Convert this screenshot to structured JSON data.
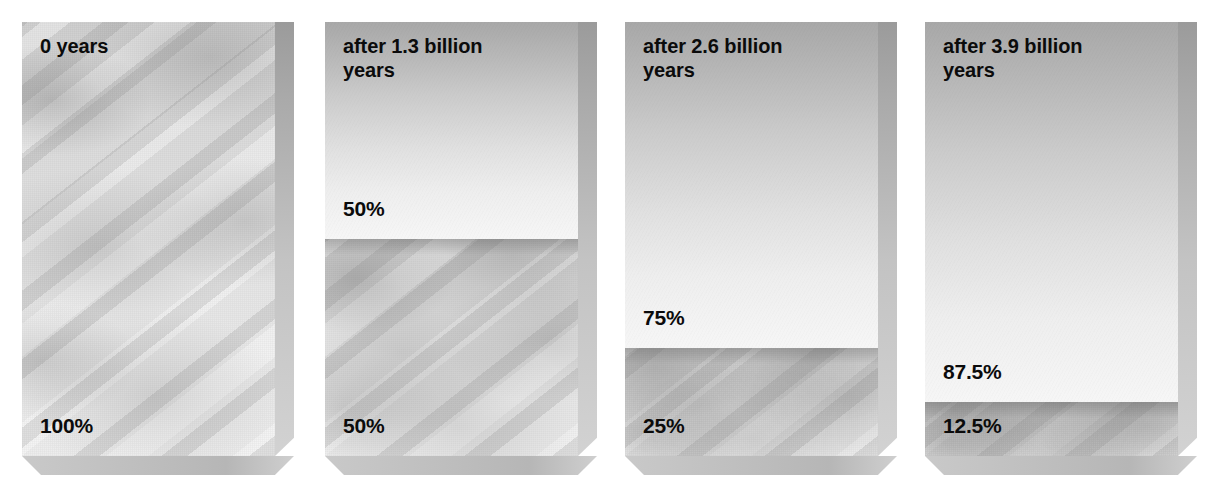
{
  "figure": {
    "type": "decay-block-sequence",
    "background_color": "#ffffff",
    "text_color": "#0b0b0b",
    "block_count": 4
  },
  "chart_data": {
    "type": "bar",
    "xlabel": "",
    "ylabel": "",
    "ylim": [
      0,
      100
    ],
    "grid": false,
    "legend": "none",
    "categories": [
      "0 years",
      "after 1.3 billion years",
      "after 2.6 billion years",
      "after 3.9 billion years"
    ],
    "series": [
      {
        "name": "daughter product (decayed)",
        "values": [
          0,
          50,
          75,
          87.5
        ],
        "fill": "smooth-gradient"
      },
      {
        "name": "parent isotope (remaining)",
        "values": [
          100,
          50,
          25,
          12.5
        ],
        "fill": "mottled-texture"
      }
    ],
    "half_life_billion_years": 1.3,
    "annotations": [
      "0 years",
      "100%",
      "after 1.3 billion years",
      "50%",
      "50%",
      "after 2.6 billion years",
      "75%",
      "25%",
      "after 3.9 billion years",
      "87.5%",
      "12.5%"
    ]
  },
  "blocks": [
    {
      "id": "block-0-years",
      "time_label": "0 years",
      "left": 22,
      "segments": [
        {
          "fill": "mottled",
          "percent_label": "100%",
          "height_pct": 100,
          "has_shadow": false
        }
      ]
    },
    {
      "id": "block-1-3-billion-years",
      "time_label": "after 1.3 billion\nyears",
      "left": 325,
      "segments": [
        {
          "fill": "smooth",
          "percent_label": "50%",
          "height_pct": 50,
          "has_shadow": false
        },
        {
          "fill": "mottled",
          "percent_label": "50%",
          "height_pct": 50,
          "has_shadow": true
        }
      ]
    },
    {
      "id": "block-2-6-billion-years",
      "time_label": "after 2.6 billion\nyears",
      "left": 625,
      "segments": [
        {
          "fill": "smooth",
          "percent_label": "75%",
          "height_pct": 75,
          "has_shadow": false
        },
        {
          "fill": "mottled",
          "percent_label": "25%",
          "height_pct": 25,
          "has_shadow": true
        }
      ]
    },
    {
      "id": "block-3-9-billion-years",
      "time_label": "after 3.9 billion\nyears",
      "left": 925,
      "segments": [
        {
          "fill": "smooth",
          "percent_label": "87.5%",
          "height_pct": 87.5,
          "has_shadow": false
        },
        {
          "fill": "mottled",
          "percent_label": "12.5%",
          "height_pct": 12.5,
          "has_shadow": true
        }
      ]
    }
  ]
}
